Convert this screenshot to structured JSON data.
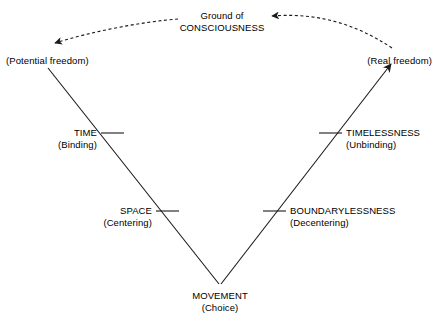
{
  "diagram": {
    "title_node": {
      "line1": "Ground of",
      "line2": "CONSCIOUSNESS"
    },
    "left_top_label": "(Potential freedom)",
    "right_top_label": "(Real freedom)",
    "nodes": [
      {
        "name": "TIME",
        "qualifier": "(Binding)"
      },
      {
        "name": "SPACE",
        "qualifier": "(Centering)"
      },
      {
        "name": "TIMELESSNESS",
        "qualifier": "(Unbinding)"
      },
      {
        "name": "BOUNDARYLESSNESS",
        "qualifier": "(Decentering)"
      },
      {
        "name": "MOVEMENT",
        "qualifier": "(Choice)"
      }
    ],
    "apex": {
      "name": "MOVEMENT",
      "qualifier": "(Choice)"
    },
    "colors": {
      "background": "#ffffff",
      "stroke": "#1a1a1a",
      "text": "#000000"
    }
  }
}
